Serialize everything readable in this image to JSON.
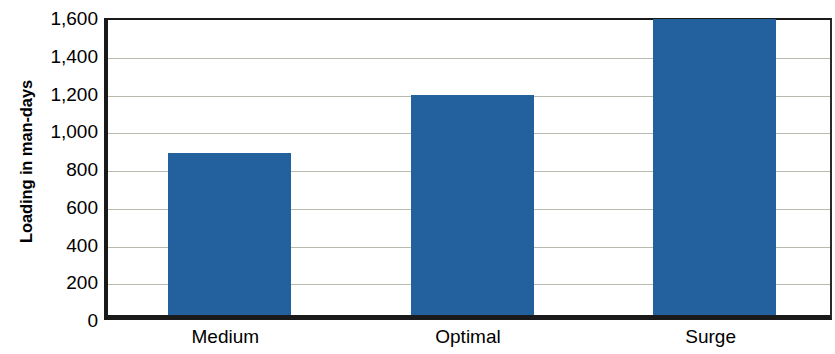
{
  "chart_data": {
    "type": "bar",
    "title": "",
    "xlabel": "",
    "ylabel": "Loading in man-days",
    "categories": [
      "Medium",
      "Optimal",
      "Surge"
    ],
    "values": [
      860,
      1165,
      1570
    ],
    "ylim": [
      0,
      1600
    ],
    "ytick_values": [
      0,
      200,
      400,
      600,
      800,
      1000,
      1200,
      1400,
      1600
    ],
    "ytick_labels": [
      "0",
      "200",
      "400",
      "600",
      "800",
      "1,000",
      "1,200",
      "1,400",
      "1,600"
    ],
    "grid": true,
    "legend": false,
    "series": [
      {
        "name": "Loading",
        "values": [
          860,
          1165,
          1570
        ]
      }
    ],
    "colors": {
      "bar": "#22609e",
      "gridline": "#b9b9ad",
      "axis": "#1a1a1a",
      "text": "#000000",
      "background": "#ffffff"
    }
  }
}
